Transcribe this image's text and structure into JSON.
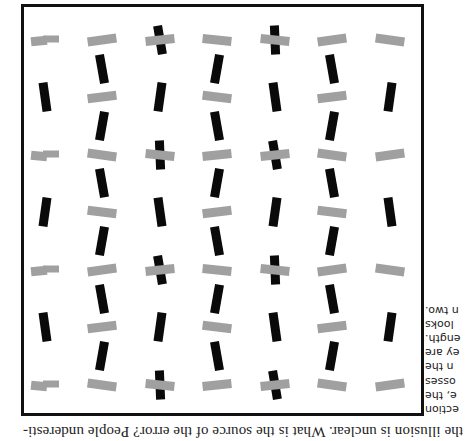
{
  "page": {
    "orientation": "rotated-180",
    "caption_bottom": "the illusion is unclear. What is the source of the error? People underesti-",
    "side_text_lines": [
      "ection",
      "e, the",
      "osses",
      "n the",
      "ey are",
      "ength.",
      "looks",
      "n two."
    ]
  },
  "figure": {
    "frame_color": "#111111",
    "gray_color": "#a0a0a0",
    "black_color": "#0a0a0a",
    "grid_spacing_px": 57.5,
    "cross_rows_y": [
      56,
      171,
      286,
      401
    ],
    "mid_rows_y": [
      114,
      229,
      344
    ],
    "cross_row_items": [
      {
        "x": 75,
        "type": "gray",
        "angle": -8
      },
      {
        "x": 133,
        "type": "gray",
        "angle": 8
      },
      {
        "x": 190,
        "type": "cross",
        "angle": -6
      },
      {
        "x": 248,
        "type": "gray",
        "angle": -6
      },
      {
        "x": 305,
        "type": "cross",
        "angle": 6
      },
      {
        "x": 363,
        "type": "gray",
        "angle": 8
      },
      {
        "x": 420,
        "type": "gray-split",
        "angle": 6
      }
    ],
    "mid_row_black_x": [
      75,
      190,
      305,
      420
    ],
    "mid_row_gray_x": [
      133,
      248,
      363
    ],
    "between_black_x": [
      133,
      248,
      363
    ],
    "between_rows_y": [
      85,
      142,
      200,
      258,
      315,
      372
    ]
  }
}
